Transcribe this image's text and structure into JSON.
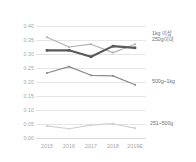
{
  "chart_data": {
    "type": "line",
    "title": "",
    "xlabel": "",
    "ylabel": "",
    "categories": [
      "2015",
      "2016",
      "2017",
      "2018",
      "2019E"
    ],
    "ylim": [
      0.0,
      0.4
    ],
    "yticks": [
      "0.00",
      "0.05",
      "0.10",
      "0.15",
      "0.20",
      "0.25",
      "0.30",
      "0.35",
      "0.40"
    ],
    "grid": true,
    "legend_position": "right-inline",
    "series": [
      {
        "name": "1kg 이상",
        "color": "#b3b3b3",
        "values": [
          0.36,
          0.325,
          0.335,
          0.305,
          0.335
        ],
        "label_x": 152,
        "label_y": 30
      },
      {
        "name": "250g이하",
        "color": "#595959",
        "values": [
          0.313,
          0.313,
          0.29,
          0.328,
          0.322
        ],
        "label_x": 152,
        "label_y": 36
      },
      {
        "name": "500g~1kg",
        "color": "#8c8c8c",
        "values": [
          0.232,
          0.255,
          0.224,
          0.222,
          0.19
        ],
        "label_x": 152,
        "label_y": 78
      },
      {
        "name": "251~500g",
        "color": "#d0d0d0",
        "values": [
          0.043,
          0.033,
          0.046,
          0.051,
          0.035
        ],
        "label_x": 150,
        "label_y": 120
      }
    ]
  },
  "colors": {
    "grid": "#e6e6e6",
    "tick_text": "#a6a6a6",
    "label_text": "#6e6e6e",
    "background": "#ffffff"
  }
}
